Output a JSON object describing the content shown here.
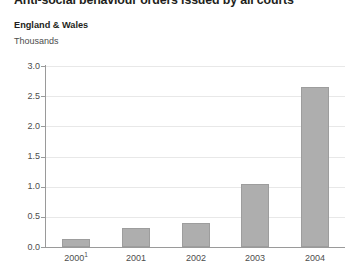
{
  "chart_data": {
    "type": "bar",
    "title": "Anti-social behaviour orders issued by all courts",
    "subtitle": "England & Wales",
    "ylabel": "Thousands",
    "xlabel": "",
    "categories": [
      "2000",
      "2001",
      "2002",
      "2003",
      "2004"
    ],
    "category_footnotes": [
      "1",
      "",
      "",
      "",
      ""
    ],
    "values": [
      0.14,
      0.32,
      0.39,
      1.04,
      2.65
    ],
    "ylim": [
      0.0,
      3.0
    ],
    "ytick_values": [
      0.0,
      0.5,
      1.0,
      1.5,
      2.0,
      2.5,
      3.0
    ],
    "ytick_labels": [
      "0.0",
      "0.5",
      "1.0",
      "1.5",
      "2.0",
      "2.5",
      "3.0"
    ],
    "grid": true,
    "grid_axis": "y",
    "legend": false,
    "bar_color": "#aeaeae",
    "bar_edge_color": "#9d9d9d",
    "gridline_color": "#e8e8e8",
    "axis_color": "#9a9a9a",
    "text_color": "#4d4d4d",
    "title_color": "#231f20"
  }
}
